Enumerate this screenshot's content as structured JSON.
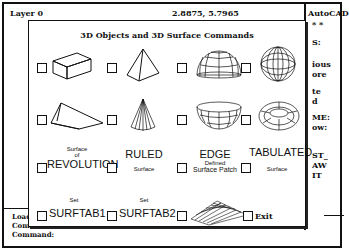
{
  "status_bar": {
    "layer": "Layer 0",
    "coordinates": "2.8875, 5.7965"
  },
  "side_menu": {
    "title": "AutoCAD",
    "stars": "* *",
    "items": [
      "S:",
      "ious",
      "ore",
      "te",
      "d",
      "ME:",
      "ow:",
      "ST_",
      "AW",
      "IT"
    ]
  },
  "command_area": {
    "lines": [
      "Loade",
      "Comma",
      "Command:"
    ]
  },
  "dialog": {
    "title": "3D Objects and 3D Surface Commands",
    "options": [
      {
        "id": "box",
        "icon": "box-icon"
      },
      {
        "id": "pyramid",
        "icon": "pyramid-icon"
      },
      {
        "id": "dome",
        "icon": "dome-icon"
      },
      {
        "id": "sphere",
        "icon": "sphere-icon"
      },
      {
        "id": "wedge",
        "icon": "wedge-icon"
      },
      {
        "id": "cone",
        "icon": "cone-icon"
      },
      {
        "id": "dish",
        "icon": "dish-icon"
      },
      {
        "id": "torus",
        "icon": "torus-icon"
      },
      {
        "id": "revsurf",
        "top": "Surface",
        "mid": "of",
        "main": "REVOLUTION"
      },
      {
        "id": "rulesurf",
        "main": "RULED",
        "bottom": "Surface"
      },
      {
        "id": "edgesurf",
        "main": "EDGE",
        "mid": "Defined",
        "bottom": "Surface Patch"
      },
      {
        "id": "tabsurf",
        "main": "TABULATED",
        "bottom": "Surface"
      },
      {
        "id": "surftab1",
        "top": "Set",
        "main": "SURFTAB1"
      },
      {
        "id": "surftab2",
        "top": "Set",
        "main": "SURFTAB2"
      },
      {
        "id": "mesh",
        "icon": "mesh-icon"
      },
      {
        "id": "exit",
        "main": "Exit"
      }
    ]
  }
}
